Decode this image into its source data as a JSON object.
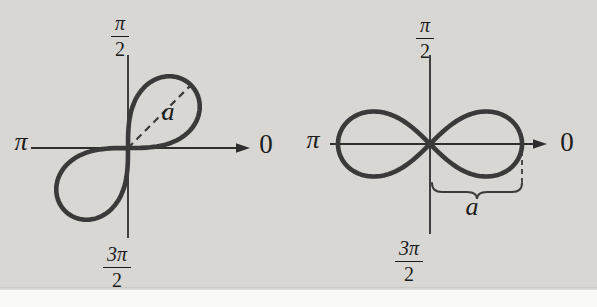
{
  "canvas": {
    "width": 597,
    "height": 307,
    "background": "#d8d7d3",
    "bottom_strip_color": "#f9f9f6",
    "edge_shadow_color": "#c7c6c2"
  },
  "style": {
    "curve_color": "#3a3a3a",
    "axis_color": "#2e2e2e",
    "label_color": "#1b1b1b",
    "curve_width": 4.6,
    "axis_width": 1.8
  },
  "figures": [
    {
      "kind": "lemniscate",
      "orientation": "diagonal-sin",
      "origin": {
        "x": 128,
        "y": 148
      },
      "a": 89,
      "axis": {
        "x1": 31,
        "x2": 250,
        "y1": 55,
        "y2": 238
      },
      "radius": {
        "angle_deg": 45,
        "label": "a"
      },
      "labels": {
        "top": {
          "num": "π",
          "den": "2",
          "x": 120,
          "y": 12
        },
        "bottom": {
          "num": "3π",
          "den": "2",
          "x": 117,
          "y": 243
        },
        "left": {
          "text": "π",
          "x": 21,
          "y": 142
        },
        "right": {
          "text": "0",
          "x": 266,
          "y": 144
        },
        "radius": {
          "text": "a",
          "x": 168,
          "y": 112
        }
      }
    },
    {
      "kind": "lemniscate",
      "orientation": "horizontal-cos",
      "origin": {
        "x": 430,
        "y": 144
      },
      "a": 92,
      "axis": {
        "x1": 330,
        "x2": 547,
        "y1": 55,
        "y2": 234
      },
      "brace": {
        "x1": 432,
        "x2": 522,
        "y": 183,
        "depth": 9,
        "dash_x": 522,
        "dash_y1": 151,
        "dash_y2": 182,
        "label": "a"
      },
      "labels": {
        "top": {
          "num": "π",
          "den": "2",
          "x": 425,
          "y": 14
        },
        "bottom": {
          "num": "3π",
          "den": "2",
          "x": 409,
          "y": 237
        },
        "left": {
          "text": "π",
          "x": 313,
          "y": 140
        },
        "right": {
          "text": "0",
          "x": 567,
          "y": 142
        },
        "brace_label": {
          "text": "a",
          "x": 472,
          "y": 207
        }
      }
    }
  ]
}
